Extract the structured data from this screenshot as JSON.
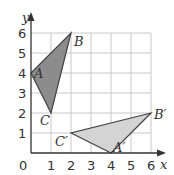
{
  "diagram": {
    "axes": {
      "x_label": "x",
      "y_label": "y",
      "origin_label": "0",
      "x_ticks": [
        "1",
        "2",
        "3",
        "4",
        "5",
        "6"
      ],
      "y_ticks": [
        "1",
        "2",
        "3",
        "4",
        "5",
        "6"
      ],
      "range": {
        "x": [
          0,
          6
        ],
        "y": [
          0,
          6
        ]
      },
      "grid": true
    },
    "colors": {
      "triangle_original": "#8c8c8c",
      "triangle_image": "#d4d4d4",
      "grid": "#c8c8c8",
      "axis": "#333333"
    },
    "triangle_original": {
      "label_A": "A",
      "label_B": "B",
      "label_C": "C",
      "vertices": {
        "A": [
          0,
          4
        ],
        "B": [
          2,
          6
        ],
        "C": [
          1,
          2
        ]
      }
    },
    "triangle_image": {
      "label_A": "A′",
      "label_B": "B′",
      "label_C": "C′",
      "vertices": {
        "A": [
          4,
          0
        ],
        "B": [
          6,
          2
        ],
        "C": [
          2,
          1
        ]
      }
    }
  }
}
